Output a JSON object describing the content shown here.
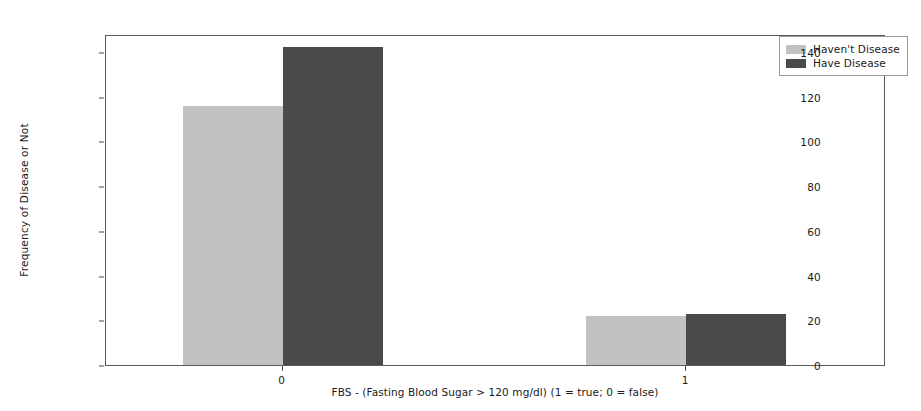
{
  "chart_data": {
    "type": "bar",
    "title": "",
    "categories": [
      "0",
      "1"
    ],
    "series": [
      {
        "name": "Haven't Disease",
        "values": [
          116,
          22
        ],
        "color": "#c2c2c2"
      },
      {
        "name": "Have Disease",
        "values": [
          142,
          23
        ],
        "color": "#4a4a4a"
      }
    ],
    "xlabel": "FBS - (Fasting Blood Sugar > 120 mg/dl) (1 = true; 0 = false)",
    "ylabel": "Frequency of Disease or Not",
    "ylim": [
      0,
      148
    ],
    "yticks": [
      0,
      20,
      40,
      60,
      80,
      100,
      120,
      140
    ],
    "ytick_labels": [
      "0",
      "20",
      "40",
      "60",
      "80",
      "100",
      "120",
      "140"
    ],
    "xtick_labels": [
      "0",
      "1"
    ],
    "grid": false,
    "legend_position": "upper right",
    "legend_entries": [
      "Haven't Disease",
      "Have Disease"
    ],
    "annotations": []
  }
}
